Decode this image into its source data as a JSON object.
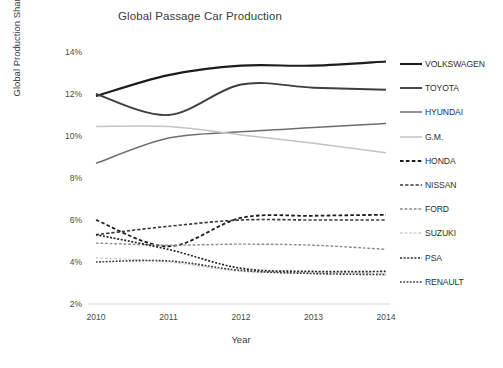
{
  "chart_data": {
    "type": "line",
    "title": "Global Passage Car Production",
    "xlabel": "Year",
    "ylabel": "Global Production Share (%)",
    "x": [
      2010,
      2011,
      2012,
      2013,
      2014
    ],
    "categories": [
      "2010",
      "2011",
      "2012",
      "2013",
      "2014"
    ],
    "xlim": [
      2010,
      2014
    ],
    "ylim": [
      2,
      14
    ],
    "yticks": [
      14,
      12,
      10,
      8,
      6,
      4,
      2
    ],
    "ytick_labels": [
      "14%",
      "12%",
      "10%",
      "8%",
      "6%",
      "4%",
      "2%"
    ],
    "grid": false,
    "legend_position": "right",
    "series": [
      {
        "name": "VOLKSWAGEN",
        "values": [
          11.9,
          12.9,
          13.35,
          13.35,
          13.55
        ],
        "color": "#1d1d1d",
        "style": "solid",
        "width": 2.1
      },
      {
        "name": "TOYOTA",
        "values": [
          12.0,
          11.0,
          12.45,
          12.3,
          12.2
        ],
        "color": "#3f3f3f",
        "style": "solid",
        "width": 1.9
      },
      {
        "name": "HYUNDAI",
        "values": [
          8.7,
          9.9,
          10.2,
          10.4,
          10.6
        ],
        "color": "#6e6e6e",
        "style": "solid",
        "width": 1.5
      },
      {
        "name": "G.M.",
        "values": [
          10.45,
          10.45,
          10.05,
          9.65,
          9.2
        ],
        "color": "#c3c3c3",
        "style": "solid",
        "width": 1.5
      },
      {
        "name": "HONDA",
        "values": [
          6.0,
          4.75,
          6.1,
          6.2,
          6.25
        ],
        "color": "#1d1d1d",
        "style": "dashed",
        "width": 1.8
      },
      {
        "name": "NISSAN",
        "values": [
          5.3,
          5.7,
          6.0,
          6.0,
          6.0
        ],
        "color": "#3a3a3a",
        "style": "dashed",
        "width": 1.6
      },
      {
        "name": "FORD",
        "values": [
          4.9,
          4.8,
          4.85,
          4.8,
          4.6
        ],
        "color": "#8a8a8a",
        "style": "dashed",
        "width": 1.4
      },
      {
        "name": "SUZUKI",
        "values": [
          4.2,
          4.0,
          3.55,
          3.5,
          3.45
        ],
        "color": "#cfcfcf",
        "style": "dashed",
        "width": 1.4
      },
      {
        "name": "PSA",
        "values": [
          5.3,
          4.6,
          3.7,
          3.55,
          3.55
        ],
        "color": "#262626",
        "style": "dotted",
        "width": 1.7
      },
      {
        "name": "RENAULT",
        "values": [
          4.0,
          4.05,
          3.6,
          3.45,
          3.4
        ],
        "color": "#3a3a3a",
        "style": "dotted",
        "width": 1.6
      }
    ]
  },
  "axis": {
    "baseline_color": "#d9d9d9"
  }
}
